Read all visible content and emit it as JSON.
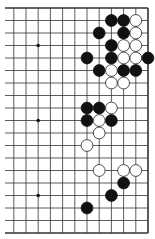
{
  "diagram": {
    "type": "go-board-partial",
    "visible_columns": [
      7,
      8,
      9,
      10,
      11,
      12,
      13,
      14,
      15,
      16,
      17,
      18
    ],
    "visible_rows": [
      0,
      1,
      2,
      3,
      4,
      5,
      6,
      7,
      8,
      9,
      10,
      11,
      12,
      13,
      14,
      15,
      16,
      17,
      18
    ],
    "edges": {
      "top": true,
      "right": true,
      "bottom": true,
      "left": false
    },
    "star_points": [
      {
        "col": 9,
        "row": 3
      },
      {
        "col": 9,
        "row": 9
      },
      {
        "col": 9,
        "row": 15
      }
    ],
    "stones": [
      {
        "color": "black",
        "col": 15,
        "row": 1
      },
      {
        "color": "black",
        "col": 16,
        "row": 1
      },
      {
        "color": "white",
        "col": 17,
        "row": 1
      },
      {
        "color": "black",
        "col": 14,
        "row": 2
      },
      {
        "color": "black",
        "col": 16,
        "row": 2
      },
      {
        "color": "white",
        "col": 17,
        "row": 2
      },
      {
        "color": "black",
        "col": 15,
        "row": 3
      },
      {
        "color": "white",
        "col": 16,
        "row": 3
      },
      {
        "color": "white",
        "col": 17,
        "row": 3
      },
      {
        "color": "black",
        "col": 13,
        "row": 4
      },
      {
        "color": "black",
        "col": 15,
        "row": 4
      },
      {
        "color": "white",
        "col": 16,
        "row": 4
      },
      {
        "color": "white",
        "col": 17,
        "row": 4
      },
      {
        "color": "black",
        "col": 18,
        "row": 4
      },
      {
        "color": "black",
        "col": 14,
        "row": 5
      },
      {
        "color": "white",
        "col": 15,
        "row": 5
      },
      {
        "color": "black",
        "col": 16,
        "row": 5
      },
      {
        "color": "black",
        "col": 17,
        "row": 5
      },
      {
        "color": "white",
        "col": 15,
        "row": 6
      },
      {
        "color": "white",
        "col": 16,
        "row": 6
      },
      {
        "color": "black",
        "col": 13,
        "row": 8
      },
      {
        "color": "black",
        "col": 14,
        "row": 8
      },
      {
        "color": "white",
        "col": 15,
        "row": 8
      },
      {
        "color": "black",
        "col": 13,
        "row": 9
      },
      {
        "color": "white",
        "col": 14,
        "row": 9
      },
      {
        "color": "black",
        "col": 15,
        "row": 9
      },
      {
        "color": "white",
        "col": 14,
        "row": 10
      },
      {
        "color": "white",
        "col": 13,
        "row": 11
      },
      {
        "color": "white",
        "col": 14,
        "row": 13
      },
      {
        "color": "white",
        "col": 16,
        "row": 13
      },
      {
        "color": "white",
        "col": 17,
        "row": 13
      },
      {
        "color": "black",
        "col": 16,
        "row": 14
      },
      {
        "color": "black",
        "col": 15,
        "row": 15
      },
      {
        "color": "black",
        "col": 13,
        "row": 16
      }
    ],
    "colors": {
      "line": "#333333",
      "black_stone": "#111111",
      "white_stone_fill": "#ffffff",
      "white_stone_stroke": "#222222",
      "background": "#ffffff"
    }
  }
}
